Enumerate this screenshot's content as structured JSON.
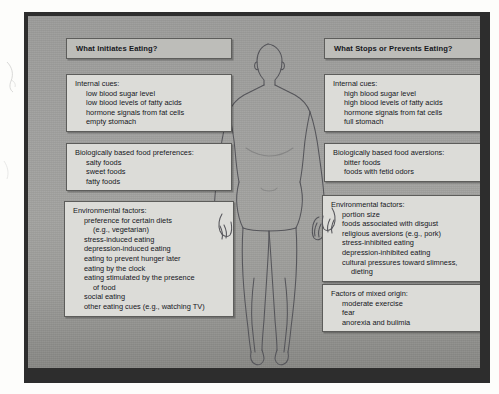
{
  "figure": {
    "body_label": "human-body-silhouette"
  },
  "columns": [
    {
      "id": "initiates",
      "header": "What Initiates Eating?",
      "boxes": [
        {
          "id": "internal-cues-initiates",
          "category": "Internal cues:",
          "items": [
            "low blood sugar level",
            "low blood levels of fatty acids",
            "hormone signals from fat cells",
            "empty stomach"
          ]
        },
        {
          "id": "food-preferences",
          "category": "Biologically based food preferences:",
          "items": [
            "salty foods",
            "sweet foods",
            "fatty foods"
          ]
        },
        {
          "id": "environmental-factors-initiates",
          "category": "Environmental factors:",
          "items": [
            "preference for certain diets",
            "(e.g., vegetarian)",
            "stress-induced eating",
            "depression-induced eating",
            "eating to prevent hunger later",
            "eating by the clock",
            "eating stimulated by the presence",
            "of food",
            "social eating",
            "other eating cues (e.g., watching TV)"
          ],
          "continuation_indices": [
            1,
            7
          ]
        }
      ]
    },
    {
      "id": "stops",
      "header": "What Stops or Prevents Eating?",
      "boxes": [
        {
          "id": "internal-cues-stops",
          "category": "Internal cues:",
          "items": [
            "high blood sugar level",
            "high blood levels of fatty acids",
            "hormone signals from fat cells",
            "full stomach"
          ]
        },
        {
          "id": "food-aversions",
          "category": "Biologically based food aversions:",
          "items": [
            "bitter foods",
            "foods with fetid odors"
          ]
        },
        {
          "id": "environmental-factors-stops",
          "category": "Environmental factors:",
          "items": [
            "portion size",
            "foods associated with disgust",
            "religious aversions (e.g., pork)",
            "stress-inhibited eating",
            "depression-inhibited eating",
            "cultural pressures toward slimness,",
            "dieting"
          ],
          "continuation_indices": [
            6
          ]
        },
        {
          "id": "mixed-origin",
          "category": "Factors of mixed origin:",
          "items": [
            "moderate exercise",
            "fear",
            "anorexia and bulimia"
          ]
        }
      ]
    }
  ],
  "colors": {
    "panel_gray": "#a0a09e",
    "frame_dark": "#2d2d2d",
    "box_fill": "#dcdcd8",
    "box_header_fill": "#bdbdb9",
    "box_border": "#5d5d5b",
    "text": "#15171c",
    "body_outline": "#55555a"
  }
}
